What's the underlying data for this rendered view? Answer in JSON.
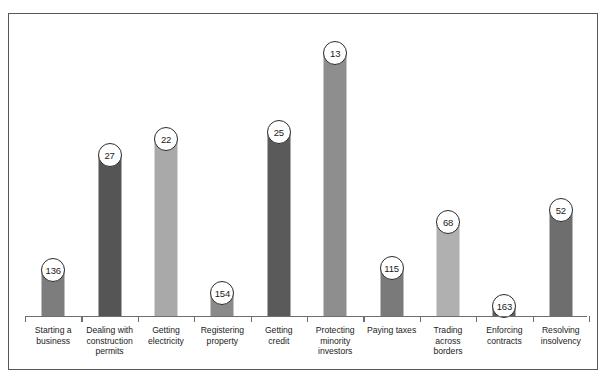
{
  "chart_data": {
    "type": "bar",
    "title": "",
    "subtitle": "",
    "xlabel": "",
    "ylabel": "",
    "grid": false,
    "legend": "none",
    "value_label_style": "circle-bubble-at-bar-top",
    "note": "Bar height is inversely proportional to the rank value; lower rank number means a taller bar.",
    "rank_scale_max": 190,
    "categories": [
      "Starting a business",
      "Dealing with construction permits",
      "Getting electricity",
      "Registering property",
      "Getting credit",
      "Protecting minority investors",
      "Paying taxes",
      "Trading across borders",
      "Enforcing contracts",
      "Resolving insolvency"
    ],
    "category_lines": [
      [
        "Starting a",
        "business"
      ],
      [
        "Dealing with",
        "construction",
        "permits"
      ],
      [
        "Getting",
        "electricity"
      ],
      [
        "Registering",
        "property"
      ],
      [
        "Getting",
        "credit"
      ],
      [
        "Protecting",
        "minority",
        "investors"
      ],
      [
        "Paying taxes"
      ],
      [
        "Trading",
        "across",
        "borders"
      ],
      [
        "Enforcing",
        "contracts"
      ],
      [
        "Resolving",
        "insolvency"
      ]
    ],
    "values": [
      136,
      27,
      22,
      154,
      25,
      13,
      115,
      68,
      163,
      52
    ],
    "bar_colors": [
      "#7d7d7d",
      "#555555",
      "#a9a9a9",
      "#8a8a8a",
      "#5a5a5a",
      "#8e8e8e",
      "#7a7a7a",
      "#b0b0b0",
      "#5c5c5c",
      "#6e6e6e"
    ],
    "bar_pixel_heights": [
      45,
      160,
      176,
      22,
      183,
      262,
      47,
      93,
      9,
      105
    ]
  },
  "style": {
    "frame_border_color": "#58585a",
    "axis_color": "#6e6e70",
    "bubble_fill": "#ffffff",
    "bubble_border": "#2a2a2a",
    "label_color": "#1b1b1b",
    "background": "#ffffff"
  }
}
